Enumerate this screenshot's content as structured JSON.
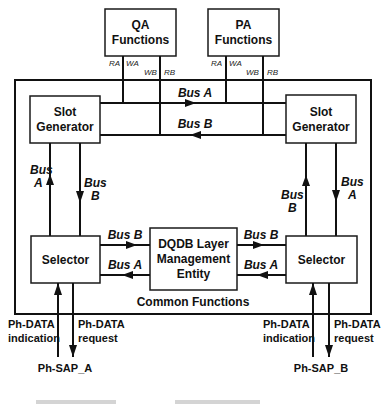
{
  "diagram": {
    "qa_box": {
      "line1": "QA",
      "line2": "Functions"
    },
    "pa_box": {
      "line1": "PA",
      "line2": "Functions"
    },
    "qa_signals": {
      "ra": "RA",
      "wa": "WA",
      "wb": "WB",
      "rb": "RB"
    },
    "pa_signals": {
      "ra": "RA",
      "wa": "WA",
      "wb": "WB",
      "rb": "RB"
    },
    "slot_generator_left": {
      "line1": "Slot",
      "line2": "Generator"
    },
    "slot_generator_right": {
      "line1": "Slot",
      "line2": "Generator"
    },
    "top_bus_a": "Bus A",
    "top_bus_b": "Bus B",
    "left_vertical": {
      "up": {
        "line1": "Bus",
        "line2": "A"
      },
      "down": {
        "line1": "Bus",
        "line2": "B"
      }
    },
    "right_vertical": {
      "up": {
        "line1": "Bus",
        "line2": "B"
      },
      "down": {
        "line1": "Bus",
        "line2": "A"
      }
    },
    "selector_left": "Selector",
    "selector_right": "Selector",
    "lme": {
      "line1": "DQDB Layer",
      "line2": "Management",
      "line3": "Entity"
    },
    "left_mid_bus_b": "Bus B",
    "left_mid_bus_a": "Bus A",
    "right_mid_bus_b": "Bus B",
    "right_mid_bus_a": "Bus A",
    "common_functions": "Common Functions",
    "sap_a": {
      "indication": {
        "line1": "Ph-DATA",
        "line2": "indication"
      },
      "request": {
        "line1": "Ph-DATA",
        "line2": "request"
      },
      "label": "Ph-SAP_A"
    },
    "sap_b": {
      "indication": {
        "line1": "Ph-DATA",
        "line2": "indication"
      },
      "request": {
        "line1": "Ph-DATA",
        "line2": "request"
      },
      "label": "Ph-SAP_B"
    }
  }
}
